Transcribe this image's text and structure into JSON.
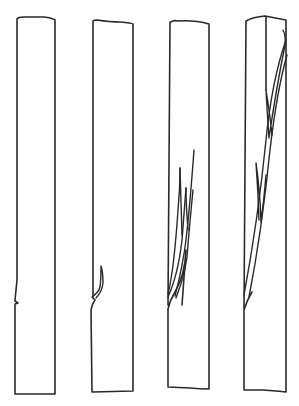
{
  "diagram": {
    "title": "",
    "stroke_color": "#2a2a2a",
    "background": "#ffffff",
    "specimens": [
      {
        "index": 1,
        "stage": "initial notch",
        "crack_count": 0
      },
      {
        "index": 2,
        "stage": "crack initiation",
        "crack_count": 1
      },
      {
        "index": 3,
        "stage": "crack branching",
        "crack_count": 4
      },
      {
        "index": 4,
        "stage": "full split",
        "crack_count": 4
      }
    ]
  }
}
